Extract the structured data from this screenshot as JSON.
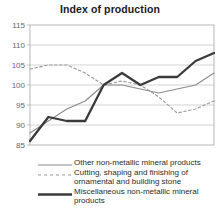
{
  "chart_data": {
    "type": "line",
    "title": "Index of production",
    "xlabel": "",
    "ylabel": "",
    "xlim": [
      1996,
      2006
    ],
    "ylim": [
      85,
      115
    ],
    "ytick_step": 5,
    "xtick_step": 2,
    "grid": true,
    "legend_position": "bottom",
    "yticks": [
      "115",
      "110",
      "105",
      "100",
      "95",
      "90",
      "85"
    ],
    "xticks": [
      "1996",
      "1998",
      "2000",
      "2002",
      "2004",
      "2006"
    ],
    "x": [
      1996,
      1997,
      1998,
      1999,
      2000,
      2001,
      2002,
      2003,
      2004,
      2005,
      2006
    ],
    "series": [
      {
        "name": "Other non-metallic mineral products",
        "style": "solid-thin",
        "color": "#8a8a8a",
        "values": [
          88,
          91,
          94,
          96,
          100,
          100,
          99,
          98,
          99,
          100,
          103
        ]
      },
      {
        "name": "Cutting, shaping and finishing of ornamental and building stone",
        "style": "dashed",
        "color": "#9a9a9a",
        "values": [
          104,
          105,
          105,
          103,
          100,
          101,
          100,
          97,
          93,
          94,
          96
        ]
      },
      {
        "name": "Miscellaneous non-metallic mineral products",
        "style": "solid-thick",
        "color": "#3a3a3a",
        "values": [
          86,
          92,
          91,
          91,
          100,
          103,
          100,
          102,
          102,
          106,
          108
        ]
      }
    ]
  },
  "legend": {
    "items": [
      {
        "label": "Other non-metallic mineral products",
        "key": "thin-solid-line-icon"
      },
      {
        "label": "Cutting, shaping and finishing of ornamental and building stone",
        "key": "dashed-line-icon"
      },
      {
        "label": "Miscellaneous non-metallic mineral products",
        "key": "thick-solid-line-icon"
      }
    ]
  },
  "colors": {
    "axis": "#b0b0b0",
    "grid": "#c8c8c8",
    "tick_label": "#666666",
    "title": "#1a1a1a"
  }
}
